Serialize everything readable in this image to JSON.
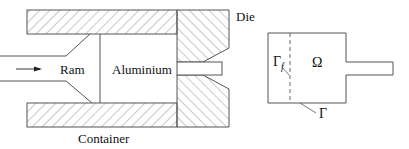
{
  "figure": {
    "left_panel": {
      "title": "Extrusion press schematic",
      "labels": {
        "die": "Die",
        "ram": "Ram",
        "aluminium": "Aluminium",
        "container": "Container"
      }
    },
    "right_panel": {
      "title": "Computational domain",
      "labels": {
        "domain": "Ω",
        "free_boundary": "Γ",
        "free_boundary_sub": "f",
        "boundary": "Γ"
      }
    },
    "colors": {
      "line": "#555555",
      "hatch": "#777777",
      "text": "#111111",
      "background": "#ffffff"
    }
  }
}
